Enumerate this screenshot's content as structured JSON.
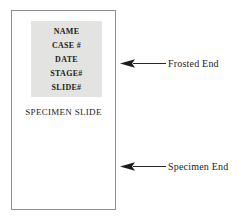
{
  "diagram": {
    "slide": {
      "name": "specimen-slide",
      "caption": "SPECIMEN SLIDE",
      "border_color": "#8f8f8f",
      "fill_color": "#ffffff"
    },
    "frosted_area": {
      "name": "frosted-label-area",
      "fill_color": "#e3e3e1",
      "lines": [
        "NAME",
        "CASE #",
        "DATE",
        "STAGE#",
        "SLIDE#"
      ]
    },
    "callouts": [
      {
        "id": "frosted-end",
        "label": "Frosted End",
        "icon": "left-arrow-icon",
        "color": "#1c1c1c"
      },
      {
        "id": "specimen-end",
        "label": "Specimen End",
        "icon": "left-arrow-icon",
        "color": "#1c1c1c"
      }
    ]
  }
}
